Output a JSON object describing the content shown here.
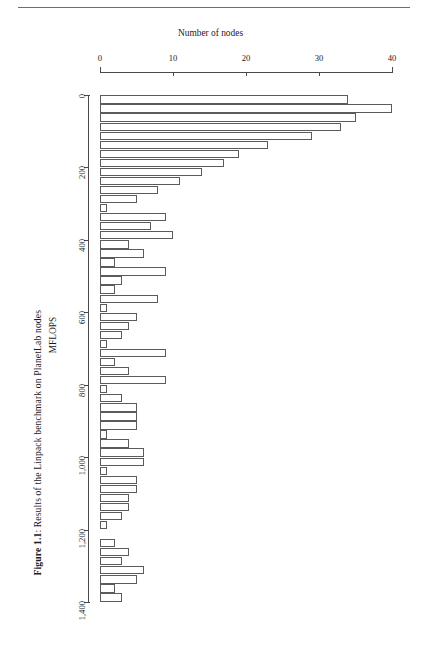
{
  "page": {
    "caption_prefix": "Figure 1.1",
    "caption_text": ": Results of the Linpack benchmark on PlanetLab nodes"
  },
  "chart_data": {
    "type": "bar",
    "orientation": "horizontal",
    "title": "",
    "xlabel": "Number of nodes",
    "ylabel": "MFLOPS",
    "xlim": [
      0,
      40
    ],
    "ylim": [
      0,
      1400
    ],
    "xticks": [
      0,
      10,
      20,
      30,
      40
    ],
    "xtick_labels": [
      "0",
      "10",
      "20",
      "30",
      "40"
    ],
    "yticks": [
      0,
      200,
      400,
      600,
      800,
      1000,
      1200,
      1400
    ],
    "ytick_labels": [
      "0",
      "200",
      "400",
      "600",
      "800",
      "1,000",
      "1,200",
      "1,400"
    ],
    "grid": false,
    "legend": null,
    "bin_width": 25,
    "categories": [
      "0-25",
      "25-50",
      "50-75",
      "75-100",
      "100-125",
      "125-150",
      "150-175",
      "175-200",
      "200-225",
      "225-250",
      "250-275",
      "275-300",
      "300-325",
      "325-350",
      "350-375",
      "375-400",
      "400-425",
      "425-450",
      "450-475",
      "475-500",
      "500-525",
      "525-550",
      "550-575",
      "575-600",
      "600-625",
      "625-650",
      "650-675",
      "675-700",
      "700-725",
      "725-750",
      "750-775",
      "775-800",
      "800-825",
      "825-850",
      "850-875",
      "875-900",
      "900-925",
      "925-950",
      "950-975",
      "975-1000",
      "1000-1025",
      "1025-1050",
      "1050-1075",
      "1075-1100",
      "1100-1125",
      "1125-1150",
      "1150-1175",
      "1175-1200",
      "1200-1225",
      "1225-1250",
      "1250-1275",
      "1275-1300",
      "1300-1325",
      "1325-1350",
      "1350-1375",
      "1375-1400"
    ],
    "values": [
      34,
      40,
      35,
      33,
      29,
      23,
      19,
      17,
      14,
      11,
      8,
      5,
      1,
      9,
      7,
      10,
      4,
      6,
      2,
      9,
      3,
      2,
      8,
      1,
      5,
      4,
      3,
      1,
      9,
      2,
      4,
      9,
      1,
      3,
      5,
      5,
      5,
      1,
      4,
      6,
      6,
      1,
      5,
      5,
      4,
      4,
      3,
      1,
      0,
      2,
      4,
      3,
      6,
      5,
      2,
      3
    ]
  }
}
